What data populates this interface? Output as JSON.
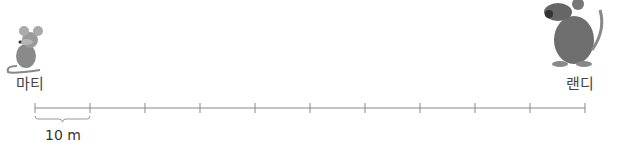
{
  "left_character": {
    "name": "마티",
    "icon": "mouse-icon"
  },
  "right_character": {
    "name": "랜디",
    "icon": "rat-icon"
  },
  "scale": {
    "segments": 10,
    "unit_label": "10 m",
    "line_color": "#888888"
  }
}
